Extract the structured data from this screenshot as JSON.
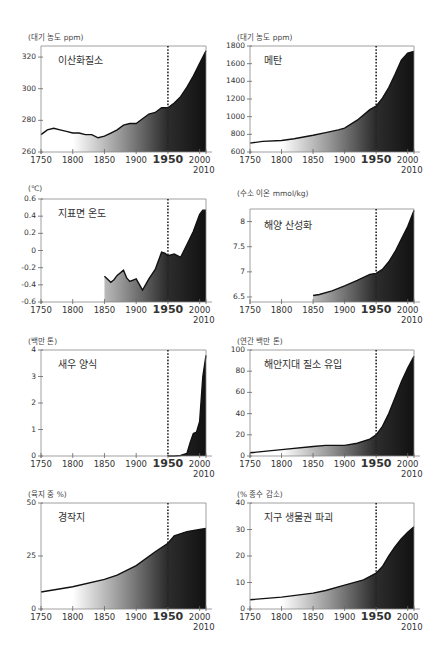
{
  "chart_data": [
    {
      "type": "area",
      "title": "이산화질소",
      "ylabel": "(대기 농도 ppm)",
      "xlabel": "",
      "xlim": [
        1750,
        2010
      ],
      "ylim": [
        260,
        327
      ],
      "yticks": [
        260,
        280,
        300,
        320
      ],
      "xticks": [
        1750,
        1800,
        1850,
        1900,
        1950,
        2000,
        2010
      ],
      "marker_year": 1950,
      "x": [
        1750,
        1760,
        1770,
        1780,
        1790,
        1800,
        1810,
        1820,
        1830,
        1840,
        1850,
        1860,
        1870,
        1880,
        1890,
        1900,
        1910,
        1920,
        1930,
        1940,
        1950,
        1960,
        1970,
        1980,
        1990,
        2000,
        2010
      ],
      "values": [
        271,
        274,
        275,
        274,
        273,
        272,
        272,
        271,
        271,
        269,
        270,
        272,
        274,
        277,
        278,
        278,
        281,
        284,
        285,
        288,
        288,
        291,
        295,
        301,
        308,
        316,
        324
      ]
    },
    {
      "type": "area",
      "title": "메탄",
      "ylabel": "(대기 농도 ppm)",
      "xlabel": "",
      "xlim": [
        1750,
        2010
      ],
      "ylim": [
        600,
        1800
      ],
      "yticks": [
        600,
        800,
        1000,
        1200,
        1400,
        1600,
        1800
      ],
      "xticks": [
        1750,
        1800,
        1850,
        1900,
        1950,
        2000,
        2010
      ],
      "marker_year": 1950,
      "x": [
        1750,
        1770,
        1800,
        1820,
        1850,
        1870,
        1890,
        1900,
        1920,
        1940,
        1950,
        1960,
        1970,
        1980,
        1990,
        2000,
        2010
      ],
      "values": [
        700,
        720,
        730,
        750,
        790,
        820,
        850,
        870,
        960,
        1080,
        1120,
        1210,
        1330,
        1480,
        1640,
        1720,
        1740
      ]
    },
    {
      "type": "area",
      "title": "지표면 온도",
      "ylabel": "(℃)",
      "xlabel": "",
      "xlim": [
        1750,
        2010
      ],
      "ylim": [
        -0.6,
        0.6
      ],
      "yticks": [
        -0.6,
        -0.4,
        -0.2,
        0,
        0.2,
        0.4,
        0.6
      ],
      "xticks": [
        1750,
        1800,
        1850,
        1900,
        1950,
        2000,
        2010
      ],
      "marker_year": 1950,
      "x": [
        1850,
        1860,
        1865,
        1870,
        1880,
        1885,
        1890,
        1900,
        1910,
        1920,
        1930,
        1940,
        1945,
        1950,
        1960,
        1970,
        1980,
        1990,
        2000,
        2005,
        2010
      ],
      "values": [
        -0.3,
        -0.37,
        -0.34,
        -0.29,
        -0.23,
        -0.32,
        -0.36,
        -0.33,
        -0.46,
        -0.33,
        -0.22,
        -0.02,
        -0.03,
        -0.06,
        -0.04,
        -0.08,
        0.07,
        0.22,
        0.42,
        0.47,
        0.47
      ]
    },
    {
      "type": "area",
      "title": "해양 산성화",
      "ylabel": "(수소 이온 mmol/kg)",
      "xlabel": "",
      "xlim": [
        1750,
        2010
      ],
      "ylim": [
        6.4,
        8.25
      ],
      "yticks": [
        6.5,
        7.0,
        7.5,
        8.0
      ],
      "xticks": [
        1750,
        1800,
        1850,
        1900,
        1950,
        2000,
        2010
      ],
      "marker_year": 1950,
      "x": [
        1850,
        1860,
        1880,
        1900,
        1920,
        1940,
        1950,
        1960,
        1970,
        1980,
        1990,
        2000,
        2010
      ],
      "values": [
        6.53,
        6.55,
        6.62,
        6.72,
        6.83,
        6.95,
        6.97,
        7.05,
        7.2,
        7.4,
        7.65,
        7.9,
        8.22
      ]
    },
    {
      "type": "area",
      "title": "새우 양식",
      "ylabel": "(백만 톤)",
      "xlabel": "",
      "xlim": [
        1750,
        2010
      ],
      "ylim": [
        0,
        4
      ],
      "yticks": [
        0,
        1,
        2,
        3,
        4
      ],
      "xticks": [
        1750,
        1800,
        1850,
        1900,
        1950,
        2000,
        2010
      ],
      "marker_year": 1950,
      "x": [
        1950,
        1960,
        1970,
        1980,
        1985,
        1990,
        1995,
        2000,
        2005,
        2010
      ],
      "values": [
        0,
        0,
        0.02,
        0.1,
        0.5,
        0.85,
        0.9,
        1.3,
        3.0,
        3.8
      ]
    },
    {
      "type": "area",
      "title": "해안지대 질소 유입",
      "ylabel": "(연간 백만 톤)",
      "xlabel": "",
      "xlim": [
        1750,
        2010
      ],
      "ylim": [
        0,
        100
      ],
      "yticks": [
        0,
        20,
        40,
        60,
        80,
        100
      ],
      "xticks": [
        1750,
        1800,
        1850,
        1900,
        1950,
        2000,
        2010
      ],
      "marker_year": 1950,
      "x": [
        1750,
        1800,
        1850,
        1870,
        1900,
        1920,
        1940,
        1950,
        1960,
        1970,
        1980,
        1990,
        2000,
        2010
      ],
      "values": [
        3,
        6,
        9,
        10,
        10,
        12,
        16,
        20,
        28,
        40,
        55,
        70,
        83,
        94
      ]
    },
    {
      "type": "area",
      "title": "경작지",
      "ylabel": "(육지 중 %)",
      "xlabel": "",
      "xlim": [
        1750,
        2010
      ],
      "ylim": [
        0,
        50
      ],
      "yticks": [
        0,
        25,
        50
      ],
      "xticks": [
        1750,
        1800,
        1850,
        1900,
        1950,
        2000,
        2010
      ],
      "marker_year": 1950,
      "x": [
        1750,
        1800,
        1850,
        1870,
        1900,
        1930,
        1950,
        1960,
        1980,
        2000,
        2010
      ],
      "values": [
        8,
        10.5,
        14,
        16,
        20.5,
        27,
        31,
        34.5,
        36.5,
        37.5,
        38
      ]
    },
    {
      "type": "area",
      "title": "지구 생물권 파괴",
      "ylabel": "(% 종수 감소)",
      "xlabel": "",
      "xlim": [
        1750,
        2010
      ],
      "ylim": [
        0,
        40
      ],
      "yticks": [
        0,
        10,
        20,
        30,
        40
      ],
      "xticks": [
        1750,
        1800,
        1850,
        1900,
        1950,
        2000,
        2010
      ],
      "marker_year": 1950,
      "x": [
        1750,
        1800,
        1850,
        1870,
        1900,
        1930,
        1950,
        1960,
        1970,
        1980,
        1990,
        2000,
        2010
      ],
      "values": [
        3.5,
        4.5,
        6,
        7,
        9,
        11,
        13.5,
        16,
        20,
        23.5,
        26.5,
        29,
        31
      ]
    }
  ]
}
